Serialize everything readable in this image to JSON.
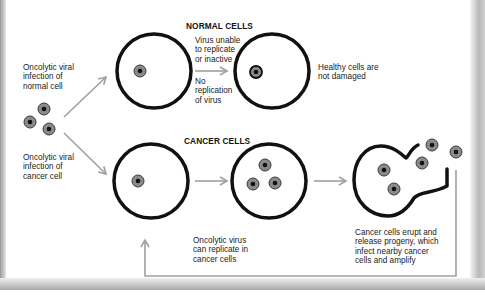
{
  "headings": {
    "normal": "NORMAL CELLS",
    "cancer": "CANCER CELLS"
  },
  "labels": {
    "infection_normal": [
      "Oncolytic viral",
      "infection of",
      "normal cell"
    ],
    "infection_cancer": [
      "Oncolytic viral",
      "infection of",
      "cancer cell"
    ],
    "virus_unable": [
      "Virus unable",
      "to replicate",
      "or inactive"
    ],
    "no_replication": [
      "No",
      "replication",
      "of virus"
    ],
    "healthy": [
      "Healthy cells are",
      "not damaged"
    ],
    "can_replicate": [
      "Oncolytic virus",
      "can replicate in",
      "cancer cells"
    ],
    "erupt": [
      "Cancer cells erupt and",
      "release progeny, which",
      "infect nearby cancer",
      "cells and amplify"
    ]
  },
  "colors": {
    "cell_outline": "#111111",
    "virus_ring": "#8a8a8a",
    "virus_core": "#111111",
    "arrow": "#a0a0a0"
  }
}
